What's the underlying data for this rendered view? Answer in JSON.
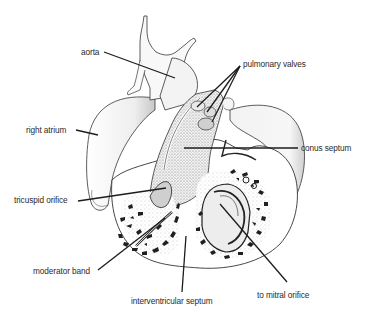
{
  "figure": {
    "background": "#ffffff",
    "ink_color": "#2b2b2b",
    "labels": [
      {
        "id": "aorta",
        "text": "aorta",
        "x": 81,
        "y": 47,
        "anchor": "left",
        "leader": [
          [
            104,
            52
          ],
          [
            175,
            78
          ]
        ]
      },
      {
        "id": "pulmonary_valves",
        "text": "pulmonary valves",
        "x": 243,
        "y": 59,
        "anchor": "left",
        "leader": [
          [
            240,
            66
          ],
          [
            197,
            107
          ],
          [
            240,
            66
          ],
          [
            207,
            112
          ],
          [
            240,
            66
          ],
          [
            212,
            122
          ]
        ]
      },
      {
        "id": "right_atrium",
        "text": "right atrium",
        "x": 26,
        "y": 125,
        "anchor": "left",
        "leader": [
          [
            76,
            130
          ],
          [
            98,
            135
          ]
        ]
      },
      {
        "id": "conus_septum",
        "text": "conus septum",
        "x": 301,
        "y": 143,
        "anchor": "left",
        "leader": [
          [
            184,
            148
          ],
          [
            298,
            148
          ]
        ]
      },
      {
        "id": "tricuspid_orifice",
        "text": "tricuspid orifice",
        "x": 14,
        "y": 195,
        "anchor": "left",
        "leader": [
          [
            78,
            201
          ],
          [
            166,
            188
          ]
        ]
      },
      {
        "id": "moderator_band",
        "text": "moderator band",
        "x": 33,
        "y": 266,
        "anchor": "left",
        "leader": [
          [
            98,
            270
          ],
          [
            165,
            218
          ]
        ]
      },
      {
        "id": "interventricular_septum",
        "text": "interventricular septum",
        "x": 131,
        "y": 296,
        "anchor": "left",
        "leader": [
          [
            182,
            292
          ],
          [
            186,
            236
          ]
        ]
      },
      {
        "id": "to_mitral_orifice",
        "text": "to mitral orifice",
        "x": 257,
        "y": 290,
        "anchor": "left",
        "leader": [
          [
            287,
            282
          ],
          [
            220,
            204
          ]
        ]
      }
    ]
  }
}
